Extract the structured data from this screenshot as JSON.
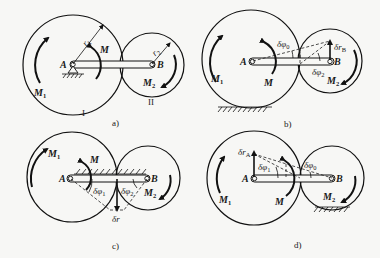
{
  "figure": {
    "panels": [
      {
        "id": "a",
        "caption": "a)",
        "labels": {
          "point_A": "A",
          "point_B": "B",
          "moment_M": "M",
          "moment_M1": "M",
          "moment_M1_sub": "1",
          "moment_M2": "M",
          "moment_M2_sub": "2",
          "radius_r1": "r",
          "radius_r1_sub": "1",
          "radius_r2": "r",
          "radius_r2_sub": "2",
          "gear_I": "I",
          "gear_II": "II"
        }
      },
      {
        "id": "b",
        "caption": "b)",
        "labels": {
          "point_A": "A",
          "point_B": "B",
          "moment_M": "M",
          "moment_M1": "M",
          "moment_M1_sub": "1",
          "moment_M2": "M",
          "moment_M2_sub": "2",
          "angle_phi0": "δφ",
          "angle_phi0_sub": "0",
          "angle_phi2": "δφ",
          "angle_phi2_sub": "2",
          "disp_rB": "δr",
          "disp_rB_sub": "B"
        }
      },
      {
        "id": "c",
        "caption": "c)",
        "labels": {
          "point_A": "A",
          "point_B": "B",
          "moment_M": "M",
          "moment_M1": "M",
          "moment_M1_sub": "1",
          "moment_M2": "M",
          "moment_M2_sub": "2",
          "angle_phi1": "δφ",
          "angle_phi1_sub": "1",
          "angle_phi2": "δφ",
          "angle_phi2_sub": "2",
          "disp_r": "δr"
        }
      },
      {
        "id": "d",
        "caption": "d)",
        "labels": {
          "point_A": "A",
          "point_B": "B",
          "moment_M": "M",
          "moment_M1": "M",
          "moment_M1_sub": "1",
          "moment_M2": "M",
          "moment_M2_sub": "2",
          "angle_phi1": "δφ",
          "angle_phi1_sub": "1",
          "angle_phi0": "δφ",
          "angle_phi0_sub": "0",
          "disp_rA": "δr",
          "disp_rA_sub": "A"
        }
      }
    ]
  }
}
